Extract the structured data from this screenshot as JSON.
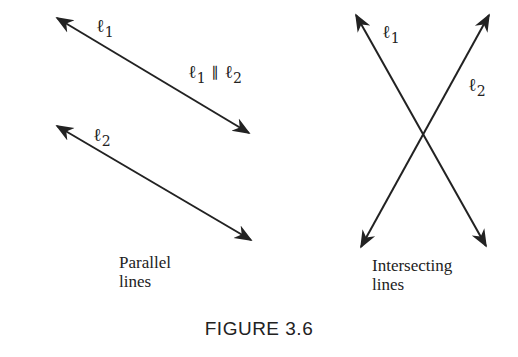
{
  "figure": {
    "caption": "FIGURE 3.6"
  },
  "parallel": {
    "line1_label": "ℓ",
    "line1_sub": "1",
    "line2_label": "ℓ",
    "line2_sub": "2",
    "relation": {
      "a": "ℓ",
      "a_sub": "1",
      "symbol": "∥",
      "b": "ℓ",
      "b_sub": "2"
    },
    "caption_line1": "Parallel",
    "caption_line2": "lines"
  },
  "intersecting": {
    "line1_label": "ℓ",
    "line1_sub": "1",
    "line2_label": "ℓ",
    "line2_sub": "2",
    "caption_line1": "Intersecting",
    "caption_line2": "lines"
  },
  "colors": {
    "stroke": "#222222",
    "background": "#ffffff"
  }
}
